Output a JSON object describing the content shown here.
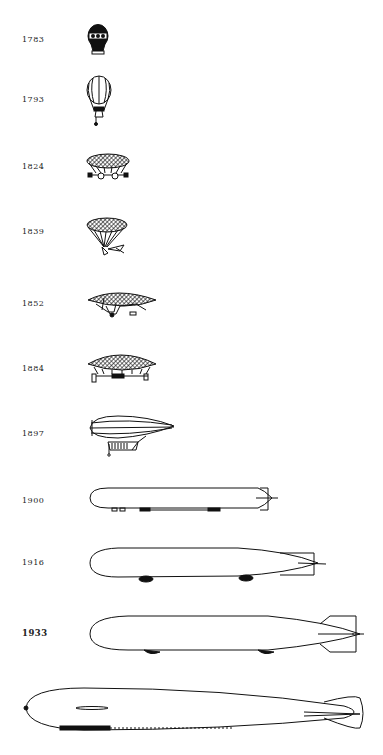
{
  "rows": [
    {
      "year": "1783",
      "craft": "montgolfier-hot-air-balloon"
    },
    {
      "year": "1793",
      "craft": "gas-balloon"
    },
    {
      "year": "1824",
      "craft": "dirigible-balloon-with-gondola"
    },
    {
      "year": "1839",
      "craft": "dirigible-balloon-with-propeller"
    },
    {
      "year": "1852",
      "craft": "giffard-steam-airship"
    },
    {
      "year": "1884",
      "craft": "la-france-airship"
    },
    {
      "year": "1897",
      "craft": "rigid-airship-with-car"
    },
    {
      "year": "1900",
      "craft": "zeppelin-lz1"
    },
    {
      "year": "1916",
      "craft": "wwi-zeppelin"
    },
    {
      "year": "1933",
      "craft": "streamlined-rigid-airship"
    },
    {
      "year": "",
      "craft": "large-passenger-airship"
    }
  ],
  "colors": {
    "ink": "#111111",
    "background": "#ffffff"
  }
}
